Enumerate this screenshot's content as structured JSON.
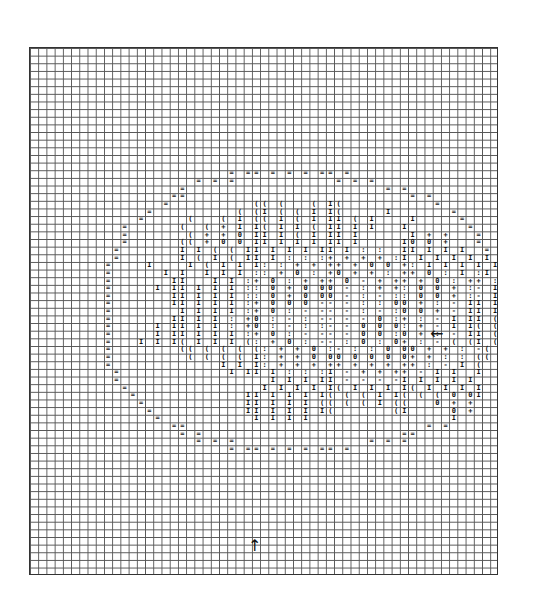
{
  "figure": {
    "grid": {
      "cols": 57,
      "rows": 69
    },
    "legend_symbols": [
      "=",
      "(",
      "I",
      "0",
      "+",
      ":",
      "-"
    ],
    "markers": {
      "right_arrow": {
        "glyph": "←",
        "row": 37,
        "label": "left-pointing arrow marker"
      },
      "bottom_arrow": {
        "glyph": "↑",
        "col": 27,
        "label": "up-pointing arrow marker"
      }
    },
    "rows": [
      "",
      "",
      "",
      "",
      "",
      "",
      "",
      "",
      "",
      "",
      "",
      "",
      "",
      "",
      "",
      "",
      "                      = = = = = = = = =",
      "                  = = =              = = =",
      "                =                          = =",
      "              = =                              = =",
      "             =           ( ( (   ( I (            =",
      "           =           ( ( I ( ( I I (     I        =",
      "          =      (   ( I ( ( I ( I I I ( I     I     =",
      "        =      (   ( + I I ( I I ( I I I I   I        =",
      "        =        ( + + 0 I I I ( I I I I       I + +   =",
      "        =      ( ( + 0 0 I I I I I I I I     I 0 0 +   =",
      "       =        I I ( ( I I I I I I I I : :  I I I I I   =",
      "       =        I ( I ( I I I : : : + + + + : I I I I I  I =",
      "      =    I     I ( I I I : : + + + + + 0 0 + : I I I I  I =",
      "      =      I I   I I I : : + 0 : + 0 + + : + + 0 : I : I I I I =",
      "     =        I I   I I : + 0 : + + + 0 - + + + + 0 : + + : I I =",
      "     =      I I I I I I : : 0 + 0 0 0 - : + + : 0 0 + : - I I I =",
      "     =        I I I I I : : 0 + 0 0 0 - : - : : 0 0 + : - I I I =",
      "     =        I I I I I : + 0 0 0 - - - : : 0 0 + : - I I I I (",
      "     =          I I I I : + 0 : - - - - : - : 0 0 + - I I I ( I",
      "     =        I I I I : + 0 : - : - - - - 0 : + : - I I I ( (",
      "     =      I I I I I : + 0 : - : : - - 0 0 0 : + - I I ( ( (",
      "     =      I I I I I I : + 0 : - - - - 0 0 : 0 + : - I I ( (",
      "     =    I I I ( I I I ( : + 0 : - - : 0 : 0 + : - ( ( I ( (",
      "      =        ( ( ( ( ( ( : + + 0 : - : : 0 0 0 + + : - ( ( (",
      "      =          ( ( ( ( I : + + 0 0 0 0 0 0 0 + + : : ( ( (",
      "      =              I I I : + + + + + + + + + + : - I (",
      "       =              I I I I : : : I - + + + + - I I   I",
      "       =                    I I I I I - - - - I I I I I",
      "        =                  I I I I I ( I I I I ( I I I I",
      "         =              I I I I I I ( ( ( I I ( ( ( 0 0 I",
      "          =             I I I I I ( ( ( ( I ( (   0 + +",
      "           =            I I I I I I (       ( I     0 +",
      "            =             I I I I                   I",
      "              = =                                = =",
      "                = =                          = =",
      "                  = = =                  = = =",
      "                      = = = = = = = = =",
      "",
      "",
      "",
      "",
      "",
      "",
      "",
      "",
      "",
      "",
      "",
      ""
    ]
  }
}
